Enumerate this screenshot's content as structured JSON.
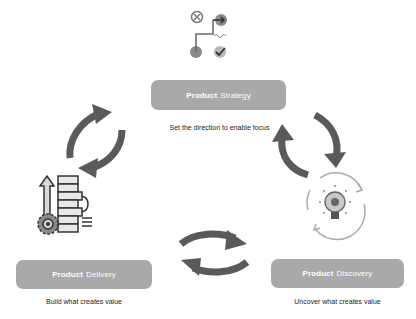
{
  "diagram": {
    "type": "cycle",
    "stages": [
      {
        "id": "strategy",
        "label_bold": "Product",
        "label_rest": "Strategy",
        "caption": "Set the direction to enable focus",
        "icon": "strategy-path-icon"
      },
      {
        "id": "discovery",
        "label_bold": "Product",
        "label_rest": "Discovery",
        "caption": "Uncover what creates value",
        "icon": "lightbulb-gear-cycle-icon"
      },
      {
        "id": "delivery",
        "label_bold": "Product",
        "label_rest": "Delivery",
        "caption": "Build what creates value",
        "icon": "build-stack-gear-icon"
      }
    ],
    "connectors": [
      {
        "between": [
          "strategy",
          "discovery"
        ],
        "icon": "bidirectional-arrows-icon"
      },
      {
        "between": [
          "discovery",
          "delivery"
        ],
        "icon": "bidirectional-arrows-icon"
      },
      {
        "between": [
          "delivery",
          "strategy"
        ],
        "icon": "bidirectional-arrows-icon"
      }
    ],
    "colors": {
      "box": "#a9a9a9",
      "arrow": "#5a5a5a",
      "icon_dark": "#4a4a4a",
      "icon_light": "#bdbdbd",
      "text": "#222222"
    }
  }
}
